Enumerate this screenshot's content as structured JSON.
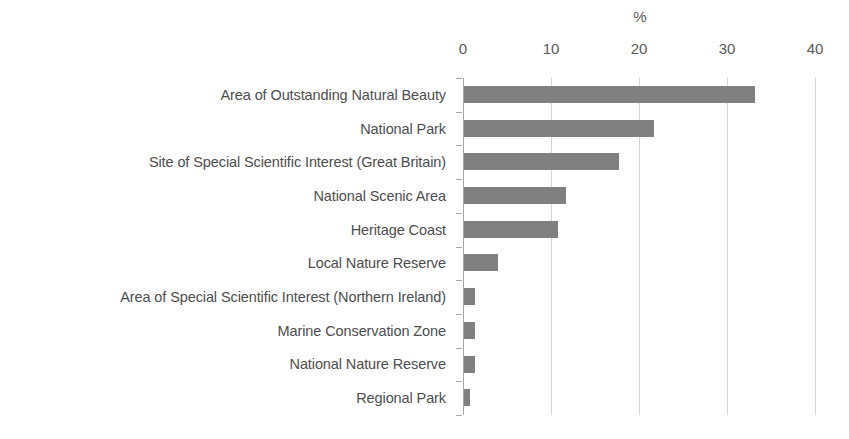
{
  "chart_data": {
    "type": "bar",
    "orientation": "horizontal",
    "title": "",
    "xlabel": "%",
    "ylabel": "",
    "xlim": [
      0,
      40
    ],
    "xticks": [
      0,
      10,
      20,
      30,
      40
    ],
    "xtick_labels": [
      "0",
      "10",
      "20",
      "30",
      "40"
    ],
    "grid": true,
    "legend": false,
    "bar_color": "#808080",
    "gridline_color": "#d4d4d4",
    "text_color": "#4d4d4d",
    "categories": [
      "Area of Outstanding Natural Beauty",
      "National Park",
      "Site of Special Scientific Interest (Great Britain)",
      "National Scenic Area",
      "Heritage Coast",
      "Local Nature Reserve",
      "Area of Special Scientific Interest (Northern Ireland)",
      "Marine Conservation Zone",
      "National Nature Reserve",
      "Regional Park"
    ],
    "values": [
      33.1,
      21.6,
      17.6,
      11.6,
      10.7,
      3.9,
      1.2,
      1.2,
      1.2,
      0.7
    ]
  }
}
